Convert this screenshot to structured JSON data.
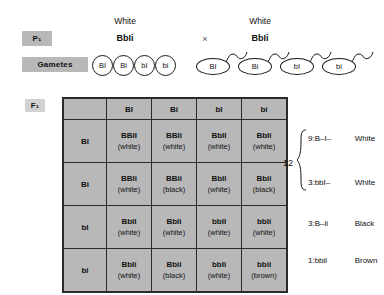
{
  "generations": {
    "p1_label": "P₁",
    "gametes_label": "Gametes",
    "f1_label": "F₁"
  },
  "cross": {
    "symbol": "×",
    "parent1": {
      "phenotype": "White",
      "genotype": "BbIi"
    },
    "parent2": {
      "phenotype": "White",
      "genotype": "BbIi"
    }
  },
  "gametes": {
    "female": [
      "BI",
      "Bi",
      "bI",
      "bi"
    ],
    "male": [
      "BI",
      "Bi",
      "bI",
      "bi"
    ]
  },
  "punnett": {
    "corner": "",
    "column_headers": [
      "BI",
      "Bi",
      "bI",
      "bi"
    ],
    "row_headers": [
      "BI",
      "Bi",
      "bI",
      "bi"
    ],
    "cells": [
      [
        {
          "genotype": "BBII",
          "phenotype": "(white)"
        },
        {
          "genotype": "BBIi",
          "phenotype": "(white)"
        },
        {
          "genotype": "BbII",
          "phenotype": "(white)"
        },
        {
          "genotype": "BbIi",
          "phenotype": "(white)"
        }
      ],
      [
        {
          "genotype": "BBIi",
          "phenotype": "(white)"
        },
        {
          "genotype": "BBii",
          "phenotype": "(black)"
        },
        {
          "genotype": "BbIi",
          "phenotype": "(white)"
        },
        {
          "genotype": "Bbii",
          "phenotype": "(black)"
        }
      ],
      [
        {
          "genotype": "BbII",
          "phenotype": "(white)"
        },
        {
          "genotype": "BbIi",
          "phenotype": "(white)"
        },
        {
          "genotype": "bbII",
          "phenotype": "(white)"
        },
        {
          "genotype": "bbIi",
          "phenotype": "(white)"
        }
      ],
      [
        {
          "genotype": "BbIi",
          "phenotype": "(white)"
        },
        {
          "genotype": "Bbii",
          "phenotype": "(black)"
        },
        {
          "genotype": "bbIi",
          "phenotype": "(white)"
        },
        {
          "genotype": "bbii",
          "phenotype": "(brown)"
        }
      ]
    ]
  },
  "summary": {
    "grouped_total": "12",
    "ratios": [
      {
        "count": "9:",
        "genotype": "B–I–",
        "phenotype": "White"
      },
      {
        "count": "3:",
        "genotype": "bbI–",
        "phenotype": "White"
      },
      {
        "count": "3:",
        "genotype": "B–ii",
        "phenotype": "Black"
      },
      {
        "count": "1:",
        "genotype": "bbii",
        "phenotype": "Brown"
      }
    ]
  },
  "colors": {
    "grid_fill": "#b8b8b8",
    "grid_line": "#2b2b2b",
    "chip_fill": "#b8b8b8",
    "page_bg": "#ffffff"
  }
}
